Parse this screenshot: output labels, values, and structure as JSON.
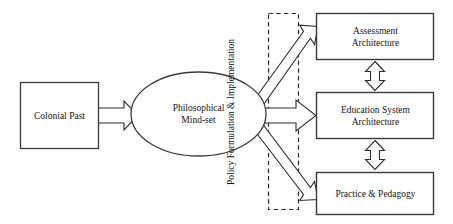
{
  "diagram": {
    "title_present": false,
    "background_color": "#ffffff",
    "stroke_color": "#2b2b2b",
    "text_color": "#141414",
    "nodes": [
      {
        "id": "colonial-past",
        "label": "Colonial Past",
        "shape": "rectangle"
      },
      {
        "id": "philosophical-mindset",
        "label": "Philosophical\nMind-set",
        "shape": "ellipse"
      },
      {
        "id": "policy-channel",
        "label": "Policy Formulation & Implementation",
        "shape": "dashed-rectangle",
        "orientation": "vertical-text"
      },
      {
        "id": "assessment-architecture",
        "label": "Assessment\nArchitecture",
        "shape": "rectangle"
      },
      {
        "id": "education-system-architecture",
        "label": "Education System\nArchitecture",
        "shape": "rectangle"
      },
      {
        "id": "practice-pedagogy",
        "label": "Practice & Pedagogy",
        "shape": "rectangle"
      }
    ],
    "connectors": [
      {
        "id": "colonial-to-mindset",
        "from": "colonial-past",
        "to": "philosophical-mindset",
        "style": "hollow-block-arrow",
        "direction": "right"
      },
      {
        "id": "mindset-to-assessment",
        "from": "philosophical-mindset",
        "to": "assessment-architecture",
        "style": "hollow-block-arrow",
        "direction": "up-right"
      },
      {
        "id": "mindset-to-education",
        "from": "philosophical-mindset",
        "to": "education-system-architecture",
        "style": "hollow-block-arrow",
        "direction": "right"
      },
      {
        "id": "mindset-to-practice",
        "from": "philosophical-mindset",
        "to": "practice-pedagogy",
        "style": "hollow-block-arrow",
        "direction": "down-right"
      },
      {
        "id": "assessment-education-link",
        "from": "assessment-architecture",
        "to": "education-system-architecture",
        "style": "hollow-double-headed-arrow",
        "direction": "vertical-bidirectional"
      },
      {
        "id": "education-practice-link",
        "from": "education-system-architecture",
        "to": "practice-pedagogy",
        "style": "hollow-double-headed-arrow",
        "direction": "vertical-bidirectional"
      }
    ]
  }
}
